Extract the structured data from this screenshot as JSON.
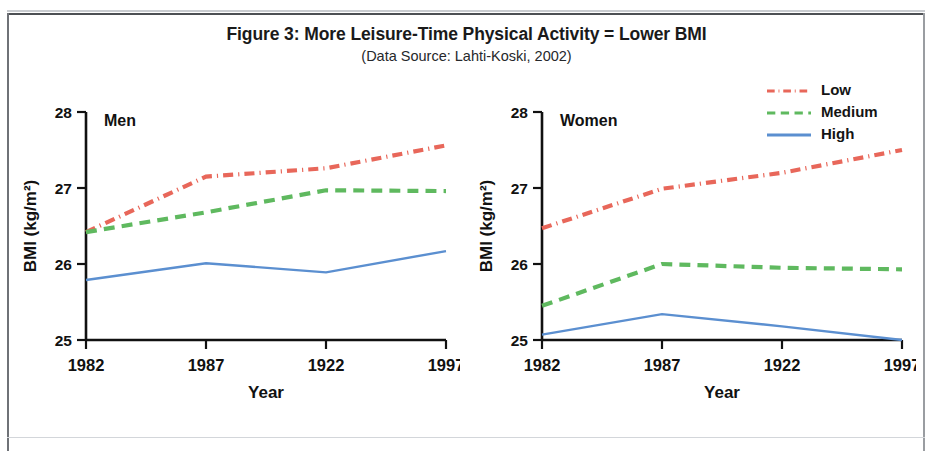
{
  "figure": {
    "title": "Figure 3: More Leisure-Time Physical Activity = Lower BMI",
    "subtitle": "(Data Source: Lahti-Koski, 2002)"
  },
  "legend": {
    "position": "top-right",
    "items": [
      {
        "label": "Low",
        "color": "#E8675A",
        "style": "dash-dot"
      },
      {
        "label": "Medium",
        "color": "#5FB95F",
        "style": "dashed"
      },
      {
        "label": "High",
        "color": "#5B8FD0",
        "style": "solid"
      }
    ]
  },
  "chart_data": [
    {
      "type": "line",
      "title": "Men",
      "panel": "left",
      "xlabel": "Year",
      "ylabel": "BMI (kg/m²)",
      "x": [
        "1982",
        "1987",
        "1922",
        "1997"
      ],
      "xticks": [
        "1982",
        "1987",
        "1922",
        "1997"
      ],
      "yticks": [
        25,
        26,
        27,
        28
      ],
      "ylim": [
        25,
        28
      ],
      "grid": false,
      "series": [
        {
          "name": "Low",
          "color": "#E8675A",
          "style": "dash-dot",
          "values": [
            26.42,
            27.15,
            27.26,
            27.56
          ]
        },
        {
          "name": "Medium",
          "color": "#5FB95F",
          "style": "dashed",
          "values": [
            26.42,
            26.68,
            26.97,
            26.96
          ]
        },
        {
          "name": "High",
          "color": "#5B8FD0",
          "style": "solid",
          "values": [
            25.79,
            26.01,
            25.89,
            26.17
          ]
        }
      ]
    },
    {
      "type": "line",
      "title": "Women",
      "panel": "right",
      "xlabel": "Year",
      "ylabel": "BMI (kg/m²)",
      "x": [
        "1982",
        "1987",
        "1922",
        "1997"
      ],
      "xticks": [
        "1982",
        "1987",
        "1922",
        "1997"
      ],
      "yticks": [
        25,
        26,
        27,
        28
      ],
      "ylim": [
        25,
        28
      ],
      "grid": false,
      "series": [
        {
          "name": "Low",
          "color": "#E8675A",
          "style": "dash-dot",
          "values": [
            26.47,
            26.99,
            27.2,
            27.5
          ]
        },
        {
          "name": "Medium",
          "color": "#5FB95F",
          "style": "dashed",
          "values": [
            25.45,
            26.0,
            25.95,
            25.93
          ]
        },
        {
          "name": "High",
          "color": "#5B8FD0",
          "style": "solid",
          "values": [
            25.07,
            25.34,
            25.18,
            25.0
          ]
        }
      ]
    }
  ]
}
